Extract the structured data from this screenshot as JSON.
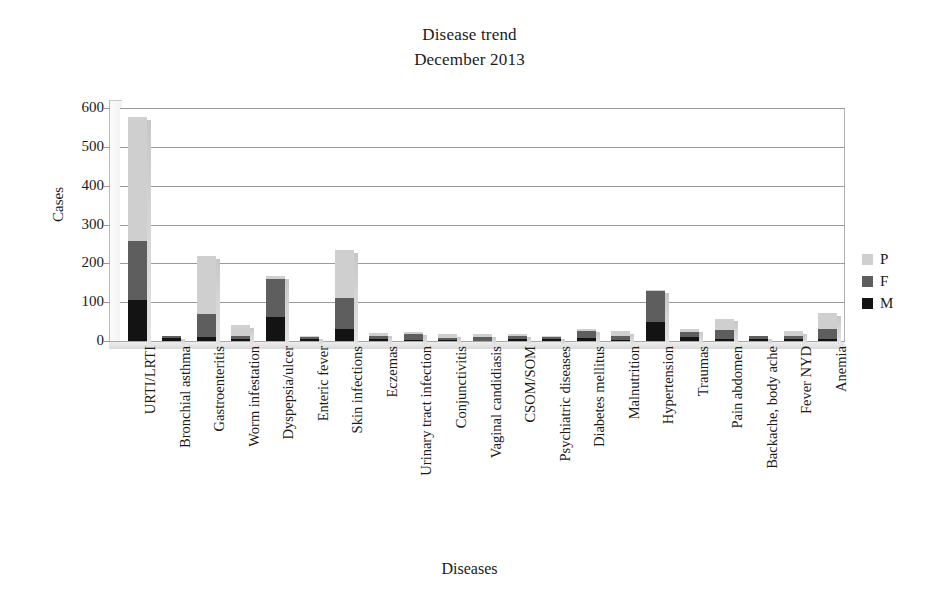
{
  "chart_data": {
    "type": "bar",
    "title": "Disease trend",
    "subtitle": "December 2013",
    "xlabel": "Diseases",
    "ylabel": "Cases",
    "ylim": [
      0,
      600
    ],
    "yticks": [
      0,
      100,
      200,
      300,
      400,
      500,
      600
    ],
    "grid": true,
    "stacked": true,
    "legend_position": "right",
    "legend": [
      "P",
      "F",
      "M"
    ],
    "series_colors": {
      "M": "#131313",
      "F": "#5e5e5e",
      "P": "#cfcfcf"
    },
    "categories": [
      "URTI/LRTI",
      "Bronchial asthma",
      "Gastroenteritis",
      "Worm infestation",
      "Dyspepsia/ulcer",
      "Enteric fever",
      "Skin infections",
      "Eczemas",
      "Urinary tract infection",
      "Conjunctivitis",
      "Vaginal candidiasis",
      "CSOM/SOM",
      "Psychiatric diseases",
      "Diabetes mellitus",
      "Malnutrition",
      "Hypertension",
      "Traumas",
      "Pain abdomen",
      "Backache, body ache",
      "Fever NYD",
      "Anemia"
    ],
    "series": [
      {
        "name": "M",
        "values": [
          105,
          8,
          10,
          5,
          62,
          6,
          30,
          4,
          3,
          3,
          0,
          6,
          4,
          8,
          3,
          48,
          10,
          6,
          5,
          4,
          6
        ]
      },
      {
        "name": "F",
        "values": [
          153,
          4,
          60,
          8,
          98,
          6,
          82,
          8,
          14,
          4,
          10,
          8,
          6,
          18,
          10,
          80,
          14,
          22,
          7,
          10,
          26
        ]
      },
      {
        "name": "P",
        "values": [
          320,
          0,
          150,
          27,
          8,
          2,
          123,
          9,
          5,
          12,
          8,
          4,
          2,
          4,
          14,
          4,
          8,
          30,
          0,
          11,
          40
        ]
      }
    ],
    "totals": [
      578,
      12,
      220,
      40,
      168,
      14,
      235,
      21,
      22,
      19,
      18,
      18,
      12,
      30,
      27,
      132,
      32,
      58,
      12,
      25,
      72
    ]
  }
}
